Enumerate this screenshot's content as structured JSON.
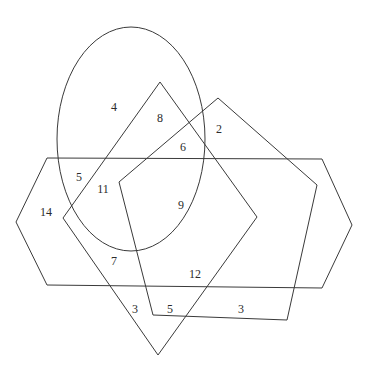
{
  "figure": {
    "width": 370,
    "height": 377,
    "background_color": "#ffffff",
    "stroke_color": "#3a3a3a",
    "text_color": "#2b2b2b",
    "stroke_width": 1
  },
  "shapes": [
    {
      "id": "ellipse",
      "name": "ellipse",
      "type": "ellipse",
      "cx": 131,
      "cy": 139,
      "rx": 74,
      "ry": 112
    },
    {
      "id": "hexagon",
      "name": "hexagon",
      "type": "polygon",
      "points": "47,158 322,159 352,225 322,288 47,285 16,222"
    },
    {
      "id": "pentagon",
      "name": "pentagon",
      "type": "polygon",
      "points": "218,98 317,185 287,320 153,315 119,182"
    },
    {
      "id": "rhombus",
      "name": "rhombus",
      "type": "polygon",
      "points": "160,82 257,217 158,355 63,218"
    }
  ],
  "labels": [
    {
      "id": "label-4",
      "text": "4",
      "x": 114,
      "y": 107
    },
    {
      "id": "label-8",
      "text": "8",
      "x": 160,
      "y": 118
    },
    {
      "id": "label-2",
      "text": "2",
      "x": 219,
      "y": 129
    },
    {
      "id": "label-6",
      "text": "6",
      "x": 183,
      "y": 147
    },
    {
      "id": "label-5a",
      "text": "5",
      "x": 79,
      "y": 177
    },
    {
      "id": "label-11",
      "text": "11",
      "x": 103,
      "y": 189
    },
    {
      "id": "label-14",
      "text": "14",
      "x": 46,
      "y": 212
    },
    {
      "id": "label-9",
      "text": "9",
      "x": 181,
      "y": 205
    },
    {
      "id": "label-7",
      "text": "7",
      "x": 114,
      "y": 261
    },
    {
      "id": "label-12",
      "text": "12",
      "x": 195,
      "y": 274
    },
    {
      "id": "label-3a",
      "text": "3",
      "x": 135,
      "y": 309
    },
    {
      "id": "label-5b",
      "text": "5",
      "x": 170,
      "y": 309
    },
    {
      "id": "label-3b",
      "text": "3",
      "x": 241,
      "y": 309
    }
  ]
}
